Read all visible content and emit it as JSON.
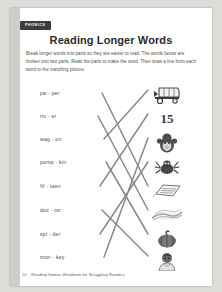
{
  "page": {
    "badge_label": "PHONICS",
    "title": "Reading Longer Words",
    "instructions": "Break longer words into parts so they are easier to read. The words below are broken into two parts. Read the parts to make the word. Then draw a line from each word to the matching picture."
  },
  "activity": {
    "words": [
      {
        "text": "pa - per",
        "word": "paper",
        "y": 10
      },
      {
        "text": "riv - er",
        "word": "river",
        "y": 33
      },
      {
        "text": "wag - on",
        "word": "wagon",
        "y": 56
      },
      {
        "text": "pump - kin",
        "word": "pumpkin",
        "y": 79
      },
      {
        "text": "fif - teen",
        "word": "fifteen",
        "y": 103
      },
      {
        "text": "doc - tor",
        "word": "doctor",
        "y": 127
      },
      {
        "text": "spi - der",
        "word": "spider",
        "y": 151
      },
      {
        "text": "mon - key",
        "word": "monkey",
        "y": 174
      }
    ],
    "pictures": [
      {
        "name": "wagon-picture",
        "icon": "wagon-icon",
        "label": "",
        "y": 4
      },
      {
        "name": "fifteen-picture",
        "icon": "number-fifteen-icon",
        "label": "15",
        "y": 28
      },
      {
        "name": "monkey-picture",
        "icon": "monkey-icon",
        "label": "",
        "y": 52
      },
      {
        "name": "spider-picture",
        "icon": "spider-icon",
        "label": "",
        "y": 76
      },
      {
        "name": "paper-picture",
        "icon": "paper-icon",
        "label": "",
        "y": 100
      },
      {
        "name": "river-picture",
        "icon": "river-icon",
        "label": "",
        "y": 124
      },
      {
        "name": "pumpkin-picture",
        "icon": "pumpkin-icon",
        "label": "",
        "y": 148
      },
      {
        "name": "doctor-picture",
        "icon": "doctor-icon",
        "label": "",
        "y": 170
      }
    ],
    "connections": [
      {
        "from_word": "pa - per",
        "to_picture": "paper-picture",
        "x1": 92,
        "y1": 13,
        "x2": 138,
        "y2": 106
      },
      {
        "from_word": "riv - er",
        "to_picture": "river-picture",
        "x1": 88,
        "y1": 36,
        "x2": 138,
        "y2": 130
      },
      {
        "from_word": "wag - on",
        "to_picture": "wagon-picture",
        "x1": 94,
        "y1": 59,
        "x2": 138,
        "y2": 10
      },
      {
        "from_word": "pump - kin",
        "to_picture": "pumpkin-picture",
        "x1": 96,
        "y1": 82,
        "x2": 138,
        "y2": 154
      },
      {
        "from_word": "fif - teen",
        "to_picture": "fifteen-picture",
        "x1": 90,
        "y1": 106,
        "x2": 138,
        "y2": 34
      },
      {
        "from_word": "doc - tor",
        "to_picture": "doctor-picture",
        "x1": 92,
        "y1": 130,
        "x2": 138,
        "y2": 176
      },
      {
        "from_word": "spi - der",
        "to_picture": "spider-picture",
        "x1": 90,
        "y1": 154,
        "x2": 138,
        "y2": 82
      },
      {
        "from_word": "mon - key",
        "to_picture": "monkey-picture",
        "x1": 94,
        "y1": 177,
        "x2": 138,
        "y2": 58
      }
    ],
    "line_color": "#8a8987"
  },
  "footer": {
    "page_number": "10",
    "book_title": "Reading Games Workbook for Struggling Readers"
  }
}
